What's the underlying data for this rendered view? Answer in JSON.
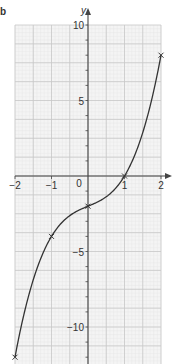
{
  "corner_label": "b",
  "chart_data": {
    "type": "line",
    "title": "",
    "xlabel": "x",
    "ylabel": "y",
    "xlim": [
      -2,
      2
    ],
    "ylim": [
      -12,
      10
    ],
    "x_ticks": [
      -2,
      -1,
      0,
      1,
      2
    ],
    "x_tick_labels": [
      "−2",
      "−1",
      "0",
      "1",
      "2"
    ],
    "y_ticks": [
      -10,
      -5,
      5,
      10
    ],
    "y_tick_labels": [
      "−10",
      "−5",
      "5",
      "10"
    ],
    "grid": true,
    "series": [
      {
        "name": "y = x³ + x − 2",
        "function": "x^3 + x - 2",
        "color": "#333333",
        "marked_points": [
          {
            "x": -2,
            "y": -12
          },
          {
            "x": -1,
            "y": -4
          },
          {
            "x": 0,
            "y": -2
          },
          {
            "x": 1,
            "y": 0
          },
          {
            "x": 2,
            "y": 8
          }
        ]
      }
    ],
    "colors": {
      "grid_major": "#c8c8c8",
      "grid_minor": "#e6e6e6",
      "grid_bg": "#f4f4f4",
      "axis": "#444444",
      "curve": "#333333"
    }
  }
}
